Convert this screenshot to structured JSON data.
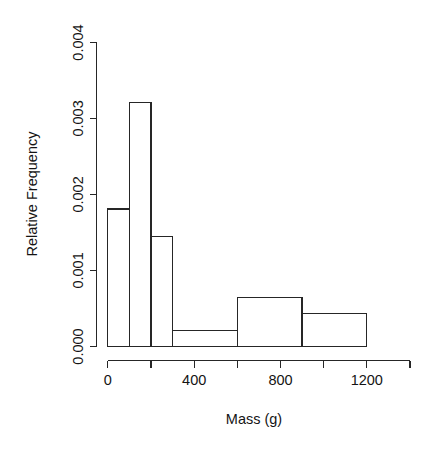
{
  "chart_data": {
    "type": "bar",
    "title": "",
    "subtitle": "",
    "xlabel": "Mass (g)",
    "ylabel": "Relative Frequency",
    "xlim": [
      0,
      1400
    ],
    "ylim": [
      0.0,
      0.004
    ],
    "grid": false,
    "legend": false,
    "x_tick_values": [
      0,
      200,
      400,
      600,
      800,
      1000,
      1200,
      1400
    ],
    "x_tick_labels": [
      "0",
      "",
      "400",
      "",
      "800",
      "",
      "1200",
      ""
    ],
    "y_tick_values": [
      0.0,
      0.001,
      0.002,
      0.003,
      0.004
    ],
    "y_tick_labels": [
      "0.000",
      "0.001",
      "0.002",
      "0.003",
      "0.004"
    ],
    "bin_edges": [
      0,
      100,
      200,
      300,
      600,
      900,
      1200
    ],
    "bins": [
      {
        "left": 0,
        "right": 100,
        "value": 0.00181
      },
      {
        "left": 100,
        "right": 200,
        "value": 0.00321
      },
      {
        "left": 200,
        "right": 300,
        "value": 0.00145
      },
      {
        "left": 300,
        "right": 600,
        "value": 0.00021
      },
      {
        "left": 600,
        "right": 900,
        "value": 0.00065
      },
      {
        "left": 900,
        "right": 1200,
        "value": 0.00043
      }
    ],
    "values": [
      0.00181,
      0.00321,
      0.00145,
      0.00021,
      0.00065,
      0.00043
    ],
    "categories": [
      "0-100",
      "100-200",
      "200-300",
      "300-600",
      "600-900",
      "900-1200"
    ],
    "colors": {
      "bar_fill": "#ffffff",
      "bar_stroke": "#262626",
      "axis": "#262626",
      "text": "#141414",
      "background": "#ffffff"
    }
  },
  "labels": {
    "y_axis_title": "Relative Frequency",
    "x_axis_title": "Mass (g)",
    "y_ticks": [
      "0.000",
      "0.001",
      "0.002",
      "0.003",
      "0.004"
    ],
    "x_ticks": [
      "0",
      "400",
      "800",
      "1200"
    ]
  }
}
